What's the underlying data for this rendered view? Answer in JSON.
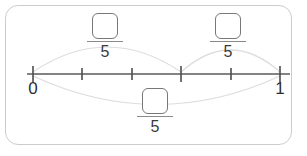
{
  "diagram": {
    "card": {
      "background_color": "#ffffff",
      "border_color": "#cccccc"
    },
    "number_line": {
      "color": "#5a5a5a",
      "start_label": "0",
      "end_label": "1",
      "start_value": 0,
      "end_value": 1,
      "divisions": 5,
      "tick_count": 6,
      "tick_values": [
        "0",
        "1/5",
        "2/5",
        "3/5",
        "4/5",
        "1"
      ],
      "tick_x_positions": [
        33,
        82,
        132,
        181,
        231,
        280
      ],
      "axis_y": 74
    },
    "arcs": [
      {
        "name": "arc-left",
        "from_tick_index": 0,
        "to_tick_index": 3,
        "direction": "above",
        "color": "#dddddd"
      },
      {
        "name": "arc-right",
        "from_tick_index": 3,
        "to_tick_index": 5,
        "direction": "above",
        "color": "#dddddd"
      },
      {
        "name": "arc-whole",
        "from_tick_index": 0,
        "to_tick_index": 5,
        "direction": "below",
        "color": "#dddddd"
      }
    ],
    "fractions": [
      {
        "name": "fraction-left",
        "numerator_value": "",
        "numerator_placeholder": "",
        "denominator": "5",
        "position": "above-left"
      },
      {
        "name": "fraction-right",
        "numerator_value": "",
        "numerator_placeholder": "",
        "denominator": "5",
        "position": "above-right"
      },
      {
        "name": "fraction-whole",
        "numerator_value": "",
        "numerator_placeholder": "",
        "denominator": "5",
        "position": "below-center"
      }
    ]
  }
}
